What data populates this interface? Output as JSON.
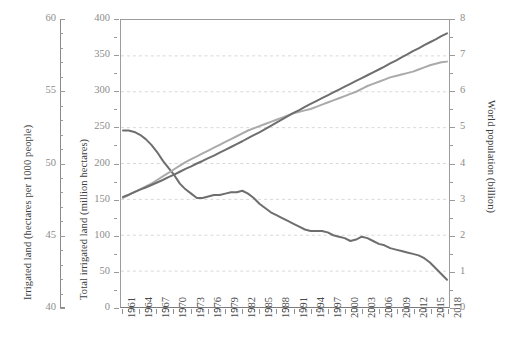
{
  "chart_data": {
    "type": "line",
    "title": "",
    "subtitle": "",
    "xlabel": "",
    "grid": "horizontal dashed gridlines inside plot area",
    "legend": "none",
    "x": [
      1961,
      1962,
      1963,
      1964,
      1965,
      1966,
      1967,
      1968,
      1969,
      1970,
      1971,
      1972,
      1973,
      1974,
      1975,
      1976,
      1977,
      1978,
      1979,
      1980,
      1981,
      1982,
      1983,
      1984,
      1985,
      1986,
      1987,
      1988,
      1989,
      1990,
      1991,
      1992,
      1993,
      1994,
      1995,
      1996,
      1997,
      1998,
      1999,
      2000,
      2001,
      2002,
      2003,
      2004,
      2005,
      2006,
      2007,
      2008,
      2009,
      2010,
      2011,
      2012,
      2013,
      2014,
      2015,
      2016,
      2017,
      2018
    ],
    "x_tick_labels": [
      "1961",
      "1964",
      "1967",
      "1970",
      "1973",
      "1976",
      "1979",
      "1982",
      "1985",
      "1988",
      "1991",
      "1994",
      "1997",
      "2000",
      "2003",
      "2006",
      "2009",
      "2012",
      "2015",
      "2018"
    ],
    "x_tick_step_years": 3,
    "xlim": [
      1961,
      2018
    ],
    "axes": [
      {
        "id": "left-outer",
        "position": "left-outer",
        "label": "Irrigated land (hectares per 1000 people)",
        "ylim": [
          40,
          60
        ],
        "ticks": [
          40,
          45,
          50,
          55,
          60
        ],
        "minor_tick_step": 1
      },
      {
        "id": "left-inner",
        "position": "left-inner",
        "label": "Total irrigated land (million hectares)",
        "ylim": [
          0,
          400
        ],
        "ticks": [
          0,
          50,
          100,
          150,
          200,
          250,
          300,
          350,
          400
        ],
        "minor_tick_step": 25
      },
      {
        "id": "right",
        "position": "right",
        "label": "World population (billion)",
        "ylim": [
          0,
          8
        ],
        "ticks": [
          0,
          1,
          2,
          3,
          4,
          5,
          6,
          7,
          8
        ],
        "minor_tick_step": 0.5
      }
    ],
    "series": [
      {
        "name": "Irrigated land (hectares per 1000 people)",
        "axis": "left-outer",
        "color": "#6e6e6e",
        "width": 2.0,
        "values": [
          52.3,
          52.3,
          52.2,
          52.0,
          51.7,
          51.3,
          50.8,
          50.2,
          49.7,
          49.2,
          48.6,
          48.2,
          47.9,
          47.6,
          47.6,
          47.7,
          47.8,
          47.8,
          47.9,
          48.0,
          48.0,
          48.1,
          47.9,
          47.6,
          47.2,
          46.9,
          46.6,
          46.4,
          46.2,
          46.0,
          45.8,
          45.6,
          45.4,
          45.3,
          45.3,
          45.3,
          45.2,
          45.0,
          44.9,
          44.8,
          44.6,
          44.7,
          44.9,
          44.8,
          44.6,
          44.4,
          44.3,
          44.1,
          44.0,
          43.9,
          43.8,
          43.7,
          43.6,
          43.4,
          43.1,
          42.7,
          42.3,
          41.9
        ]
      },
      {
        "name": "Total irrigated land (million hectares)",
        "axis": "left-inner",
        "color": "#aaaaaa",
        "width": 2.0,
        "values": [
          152,
          156,
          160,
          164,
          168,
          172,
          177,
          182,
          187,
          192,
          197,
          202,
          206,
          210,
          214,
          218,
          222,
          226,
          230,
          234,
          238,
          242,
          246,
          249,
          252,
          255,
          258,
          261,
          264,
          267,
          270,
          272,
          274,
          276,
          279,
          282,
          285,
          288,
          291,
          294,
          297,
          300,
          304,
          308,
          311,
          314,
          317,
          320,
          322,
          324,
          326,
          328,
          331,
          334,
          337,
          339,
          341,
          342
        ]
      },
      {
        "name": "World population (billion)",
        "axis": "right",
        "color": "#6e6e6e",
        "width": 2.0,
        "values": [
          3.07,
          3.13,
          3.2,
          3.27,
          3.33,
          3.4,
          3.47,
          3.54,
          3.62,
          3.69,
          3.77,
          3.85,
          3.92,
          4.0,
          4.07,
          4.15,
          4.22,
          4.3,
          4.38,
          4.46,
          4.54,
          4.62,
          4.71,
          4.79,
          4.87,
          4.96,
          5.05,
          5.14,
          5.23,
          5.32,
          5.41,
          5.49,
          5.58,
          5.66,
          5.74,
          5.82,
          5.9,
          5.98,
          6.06,
          6.14,
          6.22,
          6.3,
          6.38,
          6.46,
          6.54,
          6.62,
          6.7,
          6.79,
          6.87,
          6.96,
          7.04,
          7.13,
          7.21,
          7.3,
          7.38,
          7.46,
          7.55,
          7.63
        ]
      }
    ]
  },
  "axis_titles": {
    "left_outer": "Irrigated land (hectares per 1000 people)",
    "left_inner": "Total irrigated land (million hectares)",
    "right": "World population (billion)"
  },
  "colors": {
    "line_dark": "#6e6e6e",
    "line_light": "#aaaaaa",
    "axis": "#8f8f8f",
    "grid": "#d8d8d8",
    "tick_label": "#8c8c8c",
    "x_label": "#4a4a4a",
    "background": "#ffffff"
  }
}
